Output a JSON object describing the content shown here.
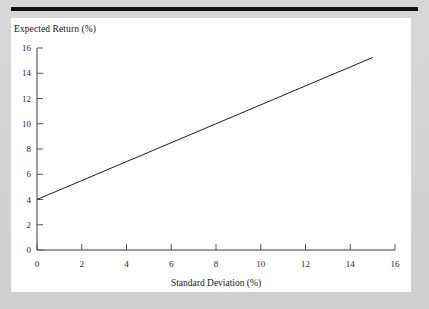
{
  "page": {
    "background_color": "#d4d4d4",
    "panel_color": "#ffffff",
    "rule_color": "#111111"
  },
  "chart_data": {
    "type": "line",
    "title": "",
    "xlabel": "Standard Deviation (%)",
    "ylabel": "Expected Return (%)",
    "xlim": [
      0,
      16
    ],
    "ylim": [
      0,
      16
    ],
    "xticks": [
      "0",
      "2",
      "4",
      "6",
      "8",
      "10",
      "12",
      "14",
      "16"
    ],
    "yticks": [
      "0",
      "2",
      "4",
      "6",
      "8",
      "10",
      "12",
      "14",
      "16"
    ],
    "xtick_values": [
      0,
      2,
      4,
      6,
      8,
      10,
      12,
      14,
      16
    ],
    "ytick_values": [
      0,
      2,
      4,
      6,
      8,
      10,
      12,
      14,
      16
    ],
    "grid": false,
    "legend": null,
    "line_color": "#1f1f1f",
    "series": [
      {
        "name": "Capital Market Line",
        "x": [
          0,
          15
        ],
        "y": [
          4,
          15.25
        ],
        "intercept": 4,
        "slope": 0.75
      }
    ],
    "points": [
      {
        "x": 0,
        "y": 4
      },
      {
        "x": 2,
        "y": 5.5
      },
      {
        "x": 4,
        "y": 7
      },
      {
        "x": 6,
        "y": 8.5
      },
      {
        "x": 8,
        "y": 10
      },
      {
        "x": 10,
        "y": 11.5
      },
      {
        "x": 12,
        "y": 13
      },
      {
        "x": 14,
        "y": 14.5
      },
      {
        "x": 15,
        "y": 15.25
      }
    ]
  }
}
